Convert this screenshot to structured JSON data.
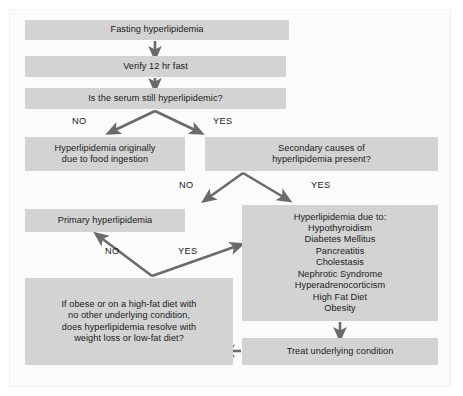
{
  "figure": {
    "type": "flowchart",
    "palette": {
      "node_fill": "#d3d3d3",
      "panel_bg": "#fbfbfb",
      "text": "#1a1a1a",
      "arrow": "#6b6b6b"
    }
  },
  "nodes": {
    "fasting": "Fasting hyperlipidemia",
    "verify": "Verify 12 hr fast",
    "is_serum": "Is the serum still hyperlipidemic?",
    "food_ingestion": "Hyperlipidemia originally\ndue to food ingestion",
    "secondary_causes": "Secondary causes of\nhyperlipidemia present?",
    "primary": "Primary hyperlipidemia",
    "due_to_list": "Hyperlipidemia due to:\nHypothyroidism\nDiabetes Mellitus\nPancreatitis\nCholestasis\nNephrotic Syndrome\nHyperadrenocorticism\nHigh Fat Diet\nObesity",
    "if_obese": "If obese or on a high-fat diet with\nno other underlying condition,\ndoes hyperlipidemia resolve with\nweight loss or low-fat diet?",
    "treat": "Treat underlying condition"
  },
  "due_to_items": [
    "Hyperlipidemia due to:",
    "Hypothyroidism",
    "Diabetes Mellitus",
    "Pancreatitis",
    "Cholestasis",
    "Nephrotic Syndrome",
    "Hyperadrenocorticism",
    "High Fat Diet",
    "Obesity"
  ],
  "edge_labels": {
    "serum_no": "NO",
    "serum_yes": "YES",
    "secondary_no": "NO",
    "secondary_yes": "YES",
    "obese_no": "NO",
    "obese_yes": "YES"
  }
}
